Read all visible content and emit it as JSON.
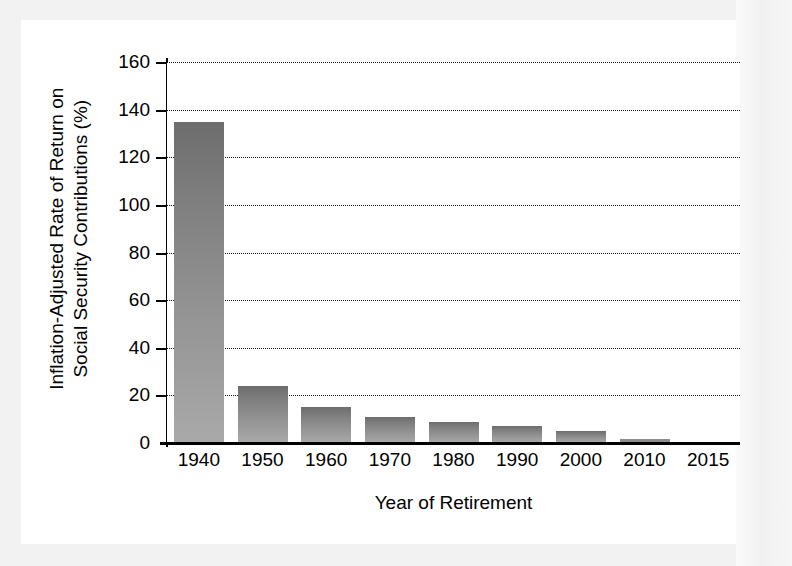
{
  "chart_data": {
    "type": "bar",
    "title": "",
    "xlabel": "Year of Retirement",
    "ylabel_line1": "Inflation-Adjusted Rate of Return on",
    "ylabel_line2": "Social Security Contributions (%)",
    "ylabel": "Inflation-Adjusted Rate of Return on Social Security Contributions (%)",
    "categories": [
      "1940",
      "1950",
      "1960",
      "1970",
      "1980",
      "1990",
      "2000",
      "2010",
      "2015"
    ],
    "values": [
      135,
      24,
      15,
      11,
      9,
      7,
      5,
      1.5,
      0.5
    ],
    "ylim": [
      0,
      160
    ],
    "yticks": [
      0,
      20,
      40,
      60,
      80,
      100,
      120,
      140,
      160
    ],
    "ytick_labels": [
      "0",
      "20",
      "40",
      "60",
      "80",
      "100",
      "120",
      "140",
      "160"
    ],
    "grid": "horizontal-dotted",
    "legend": "none",
    "bar_color_top": "#6d6d6d",
    "bar_color_bottom": "#a9a9a9",
    "axis_color": "#000000",
    "background_color": "#ffffff",
    "frame_color": "#f2f2f2"
  }
}
